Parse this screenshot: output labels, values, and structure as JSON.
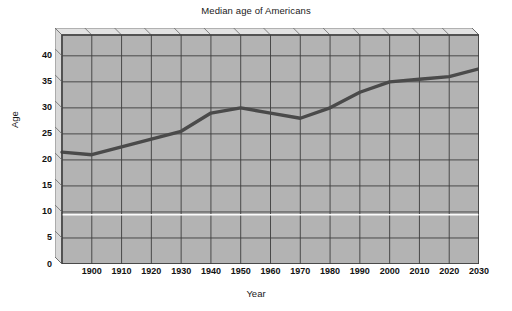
{
  "chart_data": {
    "type": "line",
    "title": "Median age of Americans",
    "xlabel": "Year",
    "ylabel": "Age",
    "x": [
      1890,
      1900,
      1910,
      1920,
      1930,
      1940,
      1950,
      1960,
      1970,
      1980,
      1990,
      2000,
      2010,
      2020,
      2030
    ],
    "values": [
      21.5,
      21.0,
      22.5,
      24.0,
      25.5,
      29.0,
      30.0,
      29.0,
      28.0,
      30.0,
      33.0,
      35.0,
      35.5,
      36.0,
      37.5
    ],
    "xlim": [
      1890,
      2030
    ],
    "ylim": [
      0,
      44
    ],
    "xticks": [
      1900,
      1910,
      1920,
      1930,
      1940,
      1950,
      1960,
      1970,
      1980,
      1990,
      2000,
      2010,
      2020,
      2030
    ],
    "yticks": [
      0,
      5,
      10,
      15,
      20,
      25,
      30,
      35,
      40
    ],
    "xtick_labels": [
      "1900",
      "1910",
      "1920",
      "1930",
      "1940",
      "1950",
      "1960",
      "1970",
      "1980",
      "1990",
      "2000",
      "2010",
      "2020",
      "2030"
    ],
    "ytick_labels": [
      "0",
      "5",
      "10",
      "15",
      "20",
      "25",
      "30",
      "35",
      "40"
    ],
    "grid": true,
    "legend": false,
    "series_color": "#4a4a4a",
    "plot_background": "#b3b3b3",
    "grid_color": "#3d3d3d"
  }
}
